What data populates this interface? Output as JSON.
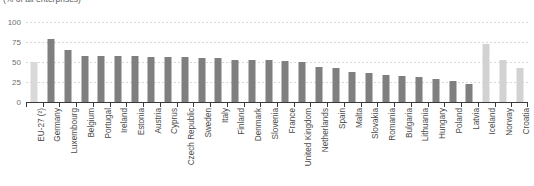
{
  "chart_data": {
    "type": "bar",
    "title": "",
    "subtitle": "(% of all enterprises)",
    "xlabel": "",
    "ylabel": "",
    "ylim": [
      0,
      100
    ],
    "yticks": [
      0,
      25,
      50,
      75,
      100
    ],
    "grid": true,
    "legend": "none",
    "categories": [
      "EU-27 (²)",
      "Germany",
      "Luxembourg",
      "Belgium",
      "Portugal",
      "Ireland",
      "Estonia",
      "Austria",
      "Cyprus",
      "Czech Republic",
      "Sweden",
      "Italy",
      "Finland",
      "Denmark",
      "Slovenia",
      "France",
      "United Kingdom",
      "Netherlands",
      "Spain",
      "Malta",
      "Slovakia",
      "Romania",
      "Bulgaria",
      "Lithuania",
      "Hungary",
      "Poland",
      "Latvia",
      "Iceland",
      "Norway",
      "Croatia"
    ],
    "values": [
      50,
      79,
      65,
      58,
      58,
      57,
      57,
      56,
      56,
      56,
      55,
      55,
      53,
      53,
      52,
      51,
      50,
      44,
      43,
      38,
      36,
      34,
      32,
      31,
      29,
      26,
      22,
      72,
      53,
      43
    ],
    "series": [
      {
        "name": "Enterprises using the internet",
        "values": [
          50,
          79,
          65,
          58,
          58,
          57,
          57,
          56,
          56,
          56,
          55,
          55,
          53,
          53,
          52,
          51,
          50,
          44,
          43,
          38,
          36,
          34,
          32,
          31,
          29,
          26,
          22,
          72,
          53,
          43
        ]
      }
    ],
    "bar_types": [
      "eu",
      "ms",
      "ms",
      "ms",
      "ms",
      "ms",
      "ms",
      "ms",
      "ms",
      "ms",
      "ms",
      "ms",
      "ms",
      "ms",
      "ms",
      "ms",
      "ms",
      "ms",
      "ms",
      "ms",
      "ms",
      "ms",
      "ms",
      "ms",
      "ms",
      "ms",
      "ms",
      "nonms",
      "nonms",
      "nonms"
    ],
    "colors": {
      "eu_aggregate": "#d9d9d9",
      "member_state": "#7f7f7f",
      "non_member": "#d2d2d2",
      "gridline": "#d8d8d8",
      "axis": "#3a3a3a",
      "tick_label": "#6e6e6e",
      "category_label": "#4a4a4a"
    }
  }
}
